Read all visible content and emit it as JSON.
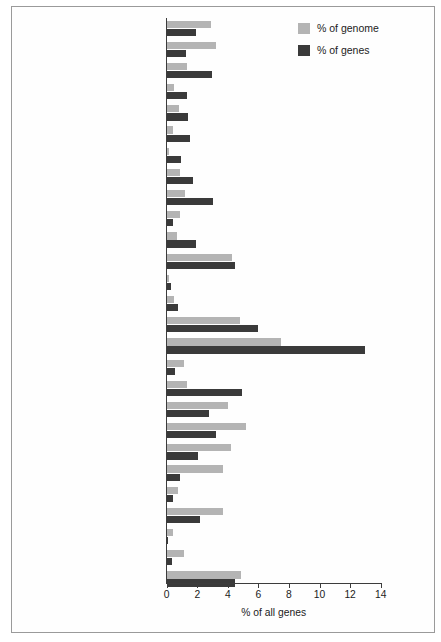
{
  "chart_data": {
    "type": "bar",
    "orientation": "horizontal",
    "title": "",
    "xlabel": "% of all genes",
    "ylabel": "",
    "xlim": [
      0,
      14
    ],
    "xticks": [
      0,
      2,
      4,
      6,
      8,
      10,
      12,
      14
    ],
    "grid": false,
    "legend_position": "top-right",
    "categories": [
      "Transporter",
      "Intracellular transporter",
      "Proto-oncogene",
      "Muscle structural protein",
      "Motor",
      "Ion channel",
      "Immunoglobulin",
      "Extracellular matrix",
      "Cytoskeletal structural protein",
      "Chaperone",
      "Cell adhesion",
      "Miscellaneous",
      "Viral protein",
      "Carrier protein",
      "Transcription factor",
      "Nucleic acid",
      "Signalling",
      "Receptor",
      "Kinase",
      "Select regulatory",
      "Transferase",
      "Synthase",
      "Lyase",
      "Oxidoreductase",
      "Ligase",
      "Isomerase",
      "Hydrolase"
    ],
    "series": [
      {
        "name": "% of genome",
        "color": "#b4b4b4",
        "values": [
          2.9,
          3.2,
          1.3,
          0.5,
          0.8,
          0.4,
          0.15,
          0.9,
          1.2,
          0.9,
          0.65,
          4.3,
          0.15,
          0.5,
          4.8,
          7.5,
          1.1,
          1.3,
          4.0,
          5.2,
          4.2,
          3.7,
          0.75,
          3.7,
          0.4,
          1.15,
          4.85
        ]
      },
      {
        "name": "% of genes",
        "color": "#3a3a3a",
        "values": [
          1.9,
          1.25,
          2.95,
          1.3,
          1.4,
          1.5,
          0.95,
          1.75,
          3.05,
          0.4,
          1.95,
          4.45,
          0.3,
          0.75,
          6.0,
          13.0,
          0.55,
          4.95,
          2.8,
          3.2,
          2.05,
          0.9,
          0.4,
          2.15,
          0.1,
          0.35,
          4.5
        ]
      }
    ]
  },
  "legend": {
    "items": [
      {
        "label": "% of genome",
        "color": "#b4b4b4"
      },
      {
        "label": "% of genes",
        "color": "#3a3a3a"
      }
    ]
  },
  "axis": {
    "x_title": "% of all genes",
    "tick_labels": [
      "0",
      "2",
      "4",
      "6",
      "8",
      "10",
      "12",
      "14"
    ]
  }
}
